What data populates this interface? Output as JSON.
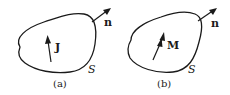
{
  "figure": {
    "panels": [
      {
        "id": "a",
        "caption": "(a)",
        "surface_label": "S",
        "normal_label": "n",
        "vector_label": "J",
        "vector_meaning": "current density"
      },
      {
        "id": "b",
        "caption": "(b)",
        "surface_label": "S",
        "normal_label": "n",
        "vector_label": "M",
        "vector_meaning": "magnetization"
      }
    ],
    "colors": {
      "stroke": "#1a1a1a",
      "background": "#ffffff"
    }
  }
}
